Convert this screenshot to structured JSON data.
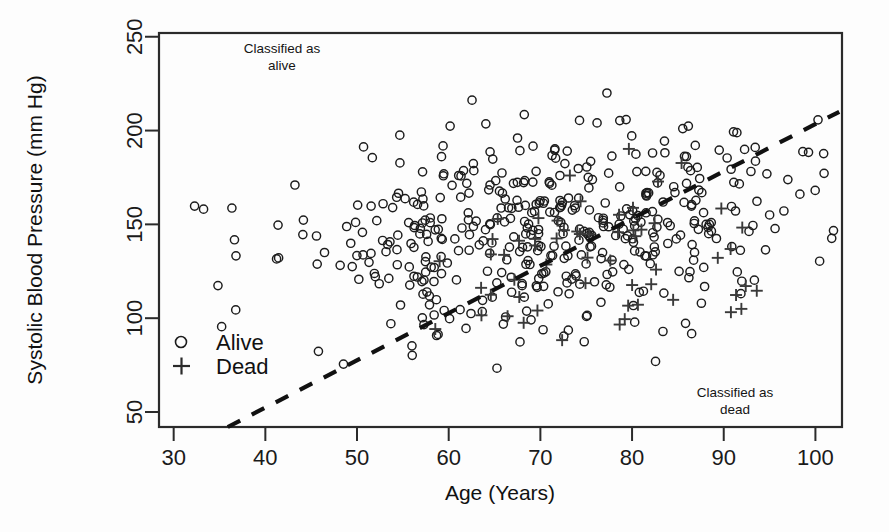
{
  "chart_data": {
    "type": "scatter",
    "title": "",
    "xlabel": "Age (Years)",
    "ylabel": "Systolic Blood Pressure (mm Hg)",
    "xlim": [
      28.4,
      102.9
    ],
    "ylim": [
      42.0,
      252.0
    ],
    "xticks": [
      30,
      40,
      50,
      60,
      70,
      80,
      90,
      100
    ],
    "yticks": [
      50,
      100,
      150,
      200,
      250
    ],
    "grid": false,
    "legend": {
      "position": "inside-left",
      "entries": [
        {
          "label": "Alive",
          "marker": "circle"
        },
        {
          "label": "Dead",
          "marker": "plus"
        }
      ]
    },
    "annotations": [
      {
        "text_line1": "Classified as",
        "text_line2": "alive",
        "x": 46.5,
        "y": 241
      },
      {
        "text_line1": "Classified as",
        "text_line2": "dead",
        "x": 85.5,
        "y": 64
      }
    ],
    "decision_boundary": {
      "style": "dashed",
      "x_start": 35.9,
      "y_start": 42.0,
      "x_end": 102.6,
      "y_end": 210.0,
      "slope": 2.52,
      "intercept": -48.5
    },
    "series": [
      {
        "name": "Alive",
        "marker": "circle",
        "n": 452,
        "x_mean": 71.5,
        "y_mean": 148.0,
        "x_sd": 13.5,
        "y_sd": 27.0,
        "correlation": 0.22,
        "x_range": [
          30.0,
          102.3
        ],
        "y_range": [
          58.0,
          246.0
        ]
      },
      {
        "name": "Dead",
        "marker": "plus",
        "n": 58,
        "x_mean": 79.5,
        "y_mean": 132.0,
        "x_sd": 9.5,
        "y_sd": 27.0,
        "correlation": 0.05,
        "x_range": [
          52.0,
          95.5
        ],
        "y_range": [
          78.0,
          196.0
        ]
      }
    ]
  },
  "axes": {
    "x_tick_labels": [
      "30",
      "40",
      "50",
      "60",
      "70",
      "80",
      "90",
      "100"
    ],
    "y_tick_labels": [
      "50",
      "100",
      "150",
      "200",
      "250"
    ],
    "x_axis_title": "Age (Years)",
    "y_axis_title": "Systolic Blood Pressure (mm Hg)"
  },
  "legend": {
    "alive_label": "Alive",
    "dead_label": "Dead"
  },
  "annotations": {
    "top_left_line1": "Classified as",
    "top_left_line2": "alive",
    "bottom_right_line1": "Classified as",
    "bottom_right_line2": "dead"
  },
  "colors": {
    "point_alive": "#1c1c1c",
    "point_dead": "#3a3a3a",
    "axis": "#2b2b2b",
    "boundary": "#111111",
    "background": "#fdfdfd"
  }
}
